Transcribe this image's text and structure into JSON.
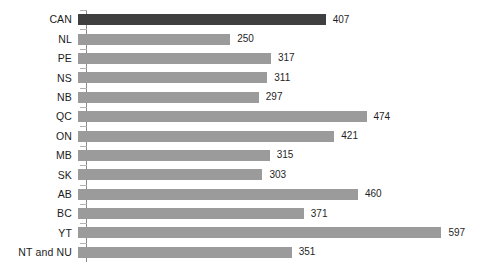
{
  "chart_data": {
    "type": "bar",
    "orientation": "horizontal",
    "title": "",
    "subtitle": "",
    "xlabel": "",
    "ylabel": "",
    "categories": [
      "CAN",
      "NL",
      "PE",
      "NS",
      "NB",
      "QC",
      "ON",
      "MB",
      "SK",
      "AB",
      "BC",
      "YT",
      "NT and NU"
    ],
    "values": [
      407,
      250,
      317,
      311,
      297,
      474,
      421,
      315,
      303,
      460,
      371,
      597,
      351
    ],
    "value_labels": [
      "407",
      "250",
      "317",
      "311",
      "297",
      "474",
      "421",
      "315",
      "303",
      "460",
      "371",
      "597",
      "351"
    ],
    "highlight_category": "CAN",
    "xlim": [
      0,
      640
    ],
    "grid": false,
    "legend": false,
    "tick_labels_x": [],
    "annotations": []
  },
  "style": {
    "bar_color": "#9b9b9b",
    "highlight_bar_color": "#3f3f3f",
    "axis_color": "#8a8a8a",
    "tick_color": "#b2b2b2",
    "label_color": "#1b1b1b",
    "value_color": "#1f1f1f",
    "background": "#ffffff"
  }
}
